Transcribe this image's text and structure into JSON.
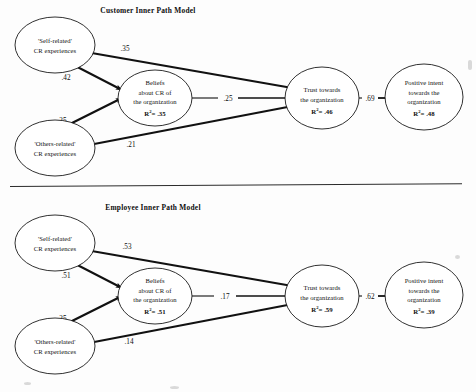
{
  "figure": {
    "type": "path-diagram",
    "width": 476,
    "height": 392,
    "panels": [
      {
        "id": "customer",
        "title": "Customer Inner Path Model",
        "nodes": [
          {
            "id": "self",
            "lines": [
              "'Self-related'",
              "CR experiences"
            ],
            "r2": null
          },
          {
            "id": "others",
            "lines": [
              "'Others-related'",
              "CR experiences"
            ],
            "r2": null
          },
          {
            "id": "beliefs",
            "lines": [
              "Beliefs",
              "about CR of",
              "the organization"
            ],
            "r2": "R²= .35",
            "r2_value": ".35"
          },
          {
            "id": "trust",
            "lines": [
              "Trust towards",
              "the organization"
            ],
            "r2": "R²= .46",
            "r2_value": ".46"
          },
          {
            "id": "intent",
            "lines": [
              "Positive intent",
              "towards the",
              "organization"
            ],
            "r2": "R²= .48",
            "r2_value": ".48"
          }
        ],
        "paths": [
          {
            "from": "self",
            "to": "trust",
            "coefficient": ".35"
          },
          {
            "from": "self",
            "to": "beliefs",
            "coefficient": ".42"
          },
          {
            "from": "others",
            "to": "beliefs",
            "coefficient": ".25"
          },
          {
            "from": "others",
            "to": "trust",
            "coefficient": ".21"
          },
          {
            "from": "beliefs",
            "to": "trust",
            "coefficient": ".25"
          },
          {
            "from": "trust",
            "to": "intent",
            "coefficient": ".69"
          }
        ]
      },
      {
        "id": "employee",
        "title": "Employee Inner Path Model",
        "nodes": [
          {
            "id": "self",
            "lines": [
              "'Self-related'",
              "CR experiences"
            ],
            "r2": null
          },
          {
            "id": "others",
            "lines": [
              "'Others-related'",
              "CR experiences"
            ],
            "r2": null
          },
          {
            "id": "beliefs",
            "lines": [
              "Beliefs",
              "about CR of",
              "the organization"
            ],
            "r2": "R²= .51",
            "r2_value": ".51"
          },
          {
            "id": "trust",
            "lines": [
              "Trust towards",
              "the organization"
            ],
            "r2": "R²= .59",
            "r2_value": ".59"
          },
          {
            "id": "intent",
            "lines": [
              "Positive intent",
              "towards the",
              "organization"
            ],
            "r2": "R²= .39",
            "r2_value": ".39"
          }
        ],
        "paths": [
          {
            "from": "self",
            "to": "trust",
            "coefficient": ".53"
          },
          {
            "from": "self",
            "to": "beliefs",
            "coefficient": ".51"
          },
          {
            "from": "others",
            "to": "beliefs",
            "coefficient": ".25"
          },
          {
            "from": "others",
            "to": "trust",
            "coefficient": ".14"
          },
          {
            "from": "beliefs",
            "to": "trust",
            "coefficient": ".17"
          },
          {
            "from": "trust",
            "to": "intent",
            "coefficient": ".62"
          }
        ]
      }
    ]
  },
  "labels": {
    "p0": {
      "title": "Customer Inner Path Model",
      "self_l1": "'Self-related'",
      "self_l2": "CR experiences",
      "others_l1": "'Others-related'",
      "others_l2": "CR experiences",
      "beliefs_l1": "Beliefs",
      "beliefs_l2": "about CR of",
      "beliefs_l3": "the organization",
      "beliefs_r2": ".35",
      "trust_l1": "Trust towards",
      "trust_l2": "the organization",
      "trust_r2": ".46",
      "intent_l1": "Positive intent",
      "intent_l2": "towards the",
      "intent_l3": "organization",
      "intent_r2": ".48",
      "c_self_trust": ".35",
      "c_self_beliefs": ".42",
      "c_others_beliefs": ".25",
      "c_others_trust": ".21",
      "c_beliefs_trust": ".25",
      "c_trust_intent": ".69"
    },
    "p1": {
      "title": "Employee Inner Path Model",
      "self_l1": "'Self-related'",
      "self_l2": "CR experiences",
      "others_l1": "'Others-related'",
      "others_l2": "CR experiences",
      "beliefs_l1": "Beliefs",
      "beliefs_l2": "about CR of",
      "beliefs_l3": "the organization",
      "beliefs_r2": ".51",
      "trust_l1": "Trust towards",
      "trust_l2": "the organization",
      "trust_r2": ".59",
      "intent_l1": "Positive intent",
      "intent_l2": "towards the",
      "intent_l3": "organization",
      "intent_r2": ".39",
      "c_self_trust": ".53",
      "c_self_beliefs": ".51",
      "c_others_beliefs": ".25",
      "c_others_trust": ".14",
      "c_beliefs_trust": ".17",
      "c_trust_intent": ".62"
    }
  },
  "r2_prefix": "R",
  "r2_sup": "2",
  "r2_eq": "= "
}
